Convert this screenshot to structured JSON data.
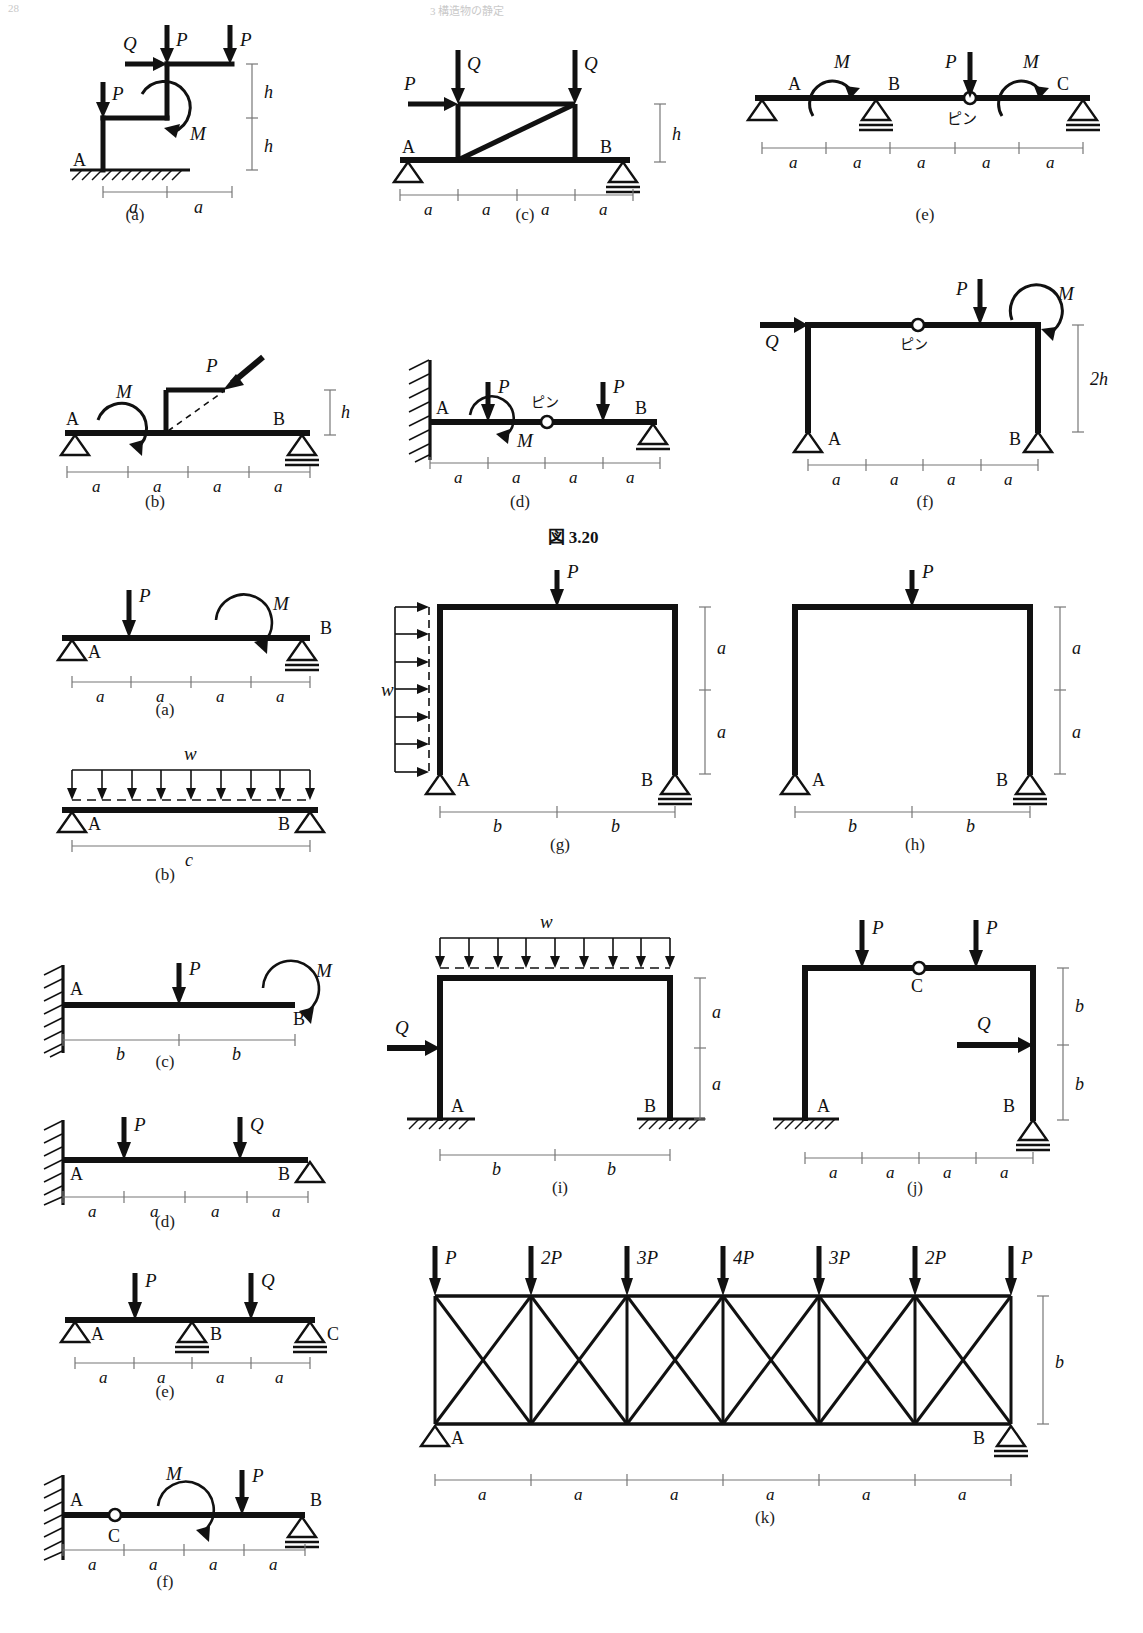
{
  "page": {
    "header_left": "28",
    "header_center": "3  構造物の静定",
    "figure_caption": "図 3.20"
  },
  "symbols": {
    "P": "P",
    "Q": "Q",
    "M": "M",
    "w": "w",
    "a": "a",
    "b": "b",
    "c": "c",
    "h": "h",
    "two_h": "2h",
    "A": "A",
    "B": "B",
    "C": "C",
    "pin": "ピン",
    "P2": "2P",
    "P3": "3P",
    "P4": "4P"
  },
  "figure_320": {
    "label": "図 3.20",
    "panels": [
      {
        "key": "a",
        "caption": "(a)",
        "type": "stepped-frame-fixed-base",
        "supports": [
          {
            "node": "A",
            "type": "fixed-ground"
          }
        ],
        "loads": [
          {
            "symbol": "Q",
            "kind": "horizontal-point"
          },
          {
            "symbol": "P",
            "kind": "vertical-point"
          },
          {
            "symbol": "P",
            "kind": "vertical-point"
          },
          {
            "symbol": "P",
            "kind": "vertical-point"
          },
          {
            "symbol": "M",
            "kind": "moment"
          }
        ],
        "dims_horizontal": [
          "a",
          "a"
        ],
        "dims_vertical": [
          "h",
          "h"
        ]
      },
      {
        "key": "b",
        "caption": "(b)",
        "type": "simple-beam-with-bracket",
        "supports": [
          {
            "node": "A",
            "type": "pin"
          },
          {
            "node": "B",
            "type": "roller"
          }
        ],
        "loads": [
          {
            "symbol": "M",
            "kind": "moment"
          },
          {
            "symbol": "P",
            "kind": "inclined-point"
          }
        ],
        "dims_horizontal": [
          "a",
          "a",
          "a",
          "a"
        ],
        "dims_vertical": [
          "h"
        ]
      },
      {
        "key": "c",
        "caption": "(c)",
        "type": "beam-with-braced-frame",
        "supports": [
          {
            "node": "A",
            "type": "pin"
          },
          {
            "node": "B",
            "type": "roller"
          }
        ],
        "loads": [
          {
            "symbol": "P",
            "kind": "horizontal-point"
          },
          {
            "symbol": "Q",
            "kind": "vertical-point"
          },
          {
            "symbol": "Q",
            "kind": "vertical-point"
          }
        ],
        "dims_horizontal": [
          "a",
          "a",
          "a",
          "a"
        ],
        "dims_vertical": [
          "h"
        ]
      },
      {
        "key": "d",
        "caption": "(d)",
        "type": "cantilever-with-pin-and-roller",
        "supports": [
          {
            "node": "A",
            "type": "wall-fixed"
          },
          {
            "node": "B",
            "type": "roller"
          }
        ],
        "hinges": [
          {
            "label": "ピン"
          }
        ],
        "loads": [
          {
            "symbol": "P",
            "kind": "vertical-point"
          },
          {
            "symbol": "M",
            "kind": "moment"
          },
          {
            "symbol": "P",
            "kind": "vertical-point"
          }
        ],
        "dims_horizontal": [
          "a",
          "a",
          "a",
          "a"
        ]
      },
      {
        "key": "e",
        "caption": "(e)",
        "type": "continuous-beam-with-hinge",
        "supports": [
          {
            "node": "A",
            "type": "pin"
          },
          {
            "node": "B",
            "type": "roller"
          },
          {
            "node": "C",
            "type": "roller"
          }
        ],
        "hinges": [
          {
            "label": "ピン"
          }
        ],
        "loads": [
          {
            "symbol": "M",
            "kind": "moment"
          },
          {
            "symbol": "P",
            "kind": "vertical-point"
          },
          {
            "symbol": "M",
            "kind": "moment"
          }
        ],
        "dims_horizontal": [
          "a",
          "a",
          "a",
          "a",
          "a"
        ]
      },
      {
        "key": "f",
        "caption": "(f)",
        "type": "portal-frame-with-hinge",
        "supports": [
          {
            "node": "A",
            "type": "pin"
          },
          {
            "node": "B",
            "type": "pin"
          }
        ],
        "hinges": [
          {
            "label": "ピン"
          }
        ],
        "loads": [
          {
            "symbol": "Q",
            "kind": "horizontal-point"
          },
          {
            "symbol": "P",
            "kind": "vertical-point"
          },
          {
            "symbol": "M",
            "kind": "moment"
          }
        ],
        "dims_horizontal": [
          "a",
          "a",
          "a",
          "a"
        ],
        "dims_vertical": [
          "2h"
        ]
      }
    ]
  },
  "problem_set": {
    "panels": [
      {
        "key": "a",
        "caption": "(a)",
        "type": "simple-beam",
        "supports": [
          {
            "node": "A",
            "type": "pin"
          },
          {
            "node": "B",
            "type": "roller"
          }
        ],
        "loads": [
          {
            "symbol": "P",
            "kind": "vertical-point"
          },
          {
            "symbol": "M",
            "kind": "moment"
          }
        ],
        "dims_horizontal": [
          "a",
          "a",
          "a",
          "a"
        ]
      },
      {
        "key": "b",
        "caption": "(b)",
        "type": "simple-beam-udl",
        "supports": [
          {
            "node": "A",
            "type": "pin"
          },
          {
            "node": "B",
            "type": "pin"
          }
        ],
        "loads": [
          {
            "symbol": "w",
            "kind": "distributed"
          }
        ],
        "dims_horizontal": [
          "c"
        ]
      },
      {
        "key": "c",
        "caption": "(c)",
        "type": "cantilever",
        "supports": [
          {
            "node": "A",
            "type": "wall-fixed"
          }
        ],
        "loads": [
          {
            "symbol": "P",
            "kind": "vertical-point"
          },
          {
            "symbol": "M",
            "kind": "moment"
          }
        ],
        "free_end": "B",
        "dims_horizontal": [
          "b",
          "b"
        ]
      },
      {
        "key": "d",
        "caption": "(d)",
        "type": "propped-cantilever",
        "supports": [
          {
            "node": "A",
            "type": "wall-fixed"
          },
          {
            "node": "B",
            "type": "pin"
          }
        ],
        "loads": [
          {
            "symbol": "P",
            "kind": "vertical-point"
          },
          {
            "symbol": "Q",
            "kind": "vertical-point"
          }
        ],
        "dims_horizontal": [
          "a",
          "a",
          "a",
          "a"
        ]
      },
      {
        "key": "e",
        "caption": "(e)",
        "type": "continuous-beam",
        "supports": [
          {
            "node": "A",
            "type": "pin"
          },
          {
            "node": "B",
            "type": "roller"
          },
          {
            "node": "C",
            "type": "roller"
          }
        ],
        "loads": [
          {
            "symbol": "P",
            "kind": "vertical-point"
          },
          {
            "symbol": "Q",
            "kind": "vertical-point"
          }
        ],
        "dims_horizontal": [
          "a",
          "a",
          "a",
          "a"
        ]
      },
      {
        "key": "f",
        "caption": "(f)",
        "type": "cantilever-hinge-roller",
        "supports": [
          {
            "node": "A",
            "type": "wall-fixed"
          },
          {
            "node": "B",
            "type": "roller"
          }
        ],
        "hinges": [
          {
            "label": "C"
          }
        ],
        "loads": [
          {
            "symbol": "M",
            "kind": "moment"
          },
          {
            "symbol": "P",
            "kind": "vertical-point"
          }
        ],
        "dims_horizontal": [
          "a",
          "a",
          "a",
          "a"
        ]
      },
      {
        "key": "g",
        "caption": "(g)",
        "type": "portal-frame",
        "supports": [
          {
            "node": "A",
            "type": "pin"
          },
          {
            "node": "B",
            "type": "roller"
          }
        ],
        "loads": [
          {
            "symbol": "w",
            "kind": "distributed-horizontal"
          },
          {
            "symbol": "P",
            "kind": "vertical-point"
          }
        ],
        "dims_horizontal": [
          "b",
          "b"
        ],
        "dims_vertical": [
          "a",
          "a"
        ]
      },
      {
        "key": "h",
        "caption": "(h)",
        "type": "portal-frame",
        "supports": [
          {
            "node": "A",
            "type": "pin"
          },
          {
            "node": "B",
            "type": "roller"
          }
        ],
        "loads": [
          {
            "symbol": "P",
            "kind": "vertical-point"
          }
        ],
        "dims_horizontal": [
          "b",
          "b"
        ],
        "dims_vertical": [
          "a",
          "a"
        ]
      },
      {
        "key": "i",
        "caption": "(i)",
        "type": "portal-frame-fixed",
        "supports": [
          {
            "node": "A",
            "type": "fixed-ground"
          },
          {
            "node": "B",
            "type": "fixed-ground"
          }
        ],
        "loads": [
          {
            "symbol": "w",
            "kind": "distributed"
          },
          {
            "symbol": "Q",
            "kind": "horizontal-point"
          }
        ],
        "dims_horizontal": [
          "b",
          "b"
        ],
        "dims_vertical": [
          "a",
          "a"
        ]
      },
      {
        "key": "j",
        "caption": "(j)",
        "type": "portal-frame-hinge",
        "supports": [
          {
            "node": "A",
            "type": "fixed-ground"
          },
          {
            "node": "B",
            "type": "roller"
          }
        ],
        "hinges": [
          {
            "label": "C"
          }
        ],
        "loads": [
          {
            "symbol": "P",
            "kind": "vertical-point"
          },
          {
            "symbol": "P",
            "kind": "vertical-point"
          },
          {
            "symbol": "Q",
            "kind": "horizontal-point"
          }
        ],
        "dims_horizontal": [
          "a",
          "a",
          "a",
          "a"
        ],
        "dims_vertical": [
          "b",
          "b"
        ]
      },
      {
        "key": "k",
        "caption": "(k)",
        "type": "truss",
        "supports": [
          {
            "node": "A",
            "type": "pin"
          },
          {
            "node": "B",
            "type": "roller"
          }
        ],
        "loads": [
          {
            "symbol": "P",
            "kind": "vertical-point"
          },
          {
            "symbol": "2P",
            "kind": "vertical-point"
          },
          {
            "symbol": "3P",
            "kind": "vertical-point"
          },
          {
            "symbol": "4P",
            "kind": "vertical-point"
          },
          {
            "symbol": "3P",
            "kind": "vertical-point"
          },
          {
            "symbol": "2P",
            "kind": "vertical-point"
          },
          {
            "symbol": "P",
            "kind": "vertical-point"
          }
        ],
        "panel_count": 6,
        "dims_horizontal": [
          "a",
          "a",
          "a",
          "a",
          "a",
          "a"
        ],
        "dims_vertical": [
          "b"
        ]
      }
    ]
  }
}
